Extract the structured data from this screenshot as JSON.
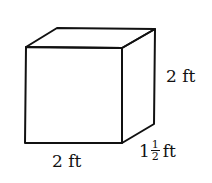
{
  "diagram": {
    "shape": "rectangular prism",
    "stroke_color": "#111111",
    "labels": {
      "height": "2 ft",
      "width": "2 ft",
      "depth_whole": "1",
      "depth_numerator": "1",
      "depth_denominator": "2",
      "depth_unit": "ft"
    }
  }
}
